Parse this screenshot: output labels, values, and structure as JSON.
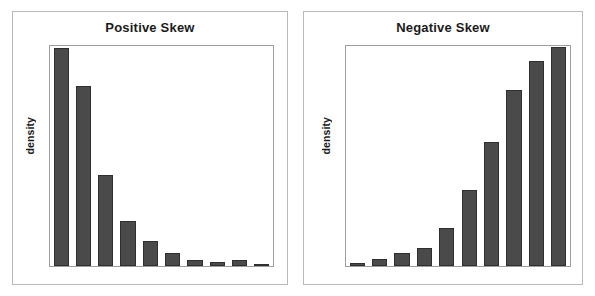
{
  "figure": {
    "background_color": "#ffffff",
    "bar_color": "#4a4a4a",
    "bar_edge_color": "#2f2f2f",
    "frame_color": "#b9b9b9",
    "plot_border_color": "#9e9e9e",
    "text_color": "#1b1b1b"
  },
  "panels": [
    {
      "id": "positive-skew",
      "title": "Positive Skew",
      "ylabel": "density"
    },
    {
      "id": "negative-skew",
      "title": "Negative Skew",
      "ylabel": "density"
    }
  ],
  "chart_data": [
    {
      "type": "bar",
      "title": "Positive Skew",
      "xlabel": "",
      "ylabel": "density",
      "categories": [
        "1",
        "2",
        "3",
        "4",
        "5",
        "6",
        "7",
        "8",
        "9",
        "10"
      ],
      "values": [
        0.99,
        0.82,
        0.415,
        0.205,
        0.115,
        0.06,
        0.028,
        0.017,
        0.028,
        0.006
      ],
      "ylim": [
        0,
        1
      ],
      "grid": false,
      "legend": "none",
      "note": "Right-skewed (positively skewed) distribution: tall bars at left, long tail to the right."
    },
    {
      "type": "bar",
      "title": "Negative Skew",
      "xlabel": "",
      "ylabel": "density",
      "categories": [
        "1",
        "2",
        "3",
        "4",
        "5",
        "6",
        "7",
        "8",
        "9",
        "10"
      ],
      "values": [
        0.012,
        0.03,
        0.06,
        0.08,
        0.175,
        0.345,
        0.565,
        0.8,
        0.93,
        0.995
      ],
      "ylim": [
        0,
        1
      ],
      "grid": false,
      "legend": "none",
      "note": "Left-skewed (negatively skewed) distribution: tall bars at right, long tail to the left."
    }
  ]
}
